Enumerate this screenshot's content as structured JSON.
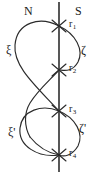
{
  "figure": {
    "background_color": "#ffffff",
    "stroke_color": "#2b2b2b",
    "axis": {
      "name": "vertical-axis-line",
      "x": 59,
      "y_top": 2,
      "y_bottom": 172,
      "stroke_width": 1.6
    },
    "poles": {
      "north_label": "N",
      "south_label": "S"
    },
    "curve_labels": {
      "upper_left": "ξ",
      "upper_right": "ζ",
      "lower_left": "ξ'",
      "lower_right": "ζ'"
    },
    "crossings": [
      {
        "label": "r",
        "subscript": "1",
        "x": 59,
        "y": 26
      },
      {
        "label": "r",
        "subscript": "2",
        "x": 59,
        "y": 70
      },
      {
        "label": "r",
        "subscript": "3",
        "x": 59,
        "y": 111
      },
      {
        "label": "r",
        "subscript": "4",
        "x": 59,
        "y": 155
      }
    ],
    "label_positions": {
      "north": {
        "x": 24,
        "y": 5
      },
      "south": {
        "x": 75,
        "y": 5
      },
      "xi": {
        "x": 6,
        "y": 44
      },
      "zeta": {
        "x": 81,
        "y": 44
      },
      "xi_prime": {
        "x": 8,
        "y": 126
      },
      "zeta_prime": {
        "x": 79,
        "y": 122
      }
    },
    "curves": [
      {
        "name": "upper-left-lobe",
        "path": "M 59,26 C 40,16 17,22 15,45 C 13,66 35,85 59,111"
      },
      {
        "name": "upper-right-lobe",
        "path": "M 59,26 C 76,34 84,50 78,62 C 72,73 63,70 59,70"
      },
      {
        "name": "upper-through-strand",
        "path": "M 59,70 C 50,80 38,90 30,103 C 24,113 24,126 30,137"
      },
      {
        "name": "lower-left-lobe",
        "path": "M 59,111 C 42,104 22,110 20,128 C 18,146 38,158 59,155"
      },
      {
        "name": "lower-right-lobe",
        "path": "M 59,111 C 76,118 84,134 78,146 C 72,156 64,157 59,155"
      },
      {
        "name": "lower-tail-strand",
        "path": "M 30,137 C 38,147 48,153 59,155"
      }
    ],
    "tick_marks": {
      "name": "crossing-x-marks",
      "half_length": 7,
      "angle_deg": 62
    }
  }
}
